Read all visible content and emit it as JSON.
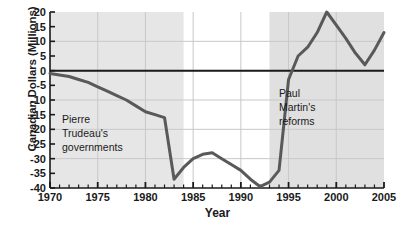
{
  "chart_data": {
    "type": "line",
    "title": "",
    "xlabel": "Year",
    "ylabel": "Canadian Dollars (Millions)",
    "xlim": [
      1970,
      2005
    ],
    "ylim": [
      -40,
      20
    ],
    "xticks": [
      1970,
      1975,
      1980,
      1985,
      1990,
      1995,
      2000,
      2005
    ],
    "xtick_labels": [
      "1970",
      "1975",
      "1980",
      "1985",
      "1990",
      "1995",
      "2000",
      "2005"
    ],
    "xminor_tick_step": 1,
    "yticks": [
      20,
      15,
      10,
      5,
      0,
      -5,
      -10,
      -15,
      -20,
      -25,
      -30,
      -35,
      -40
    ],
    "ytick_labels": [
      "20",
      "15",
      "10",
      "5",
      "0",
      "-5",
      "-10",
      "-15",
      "-20",
      "-25",
      "-30",
      "-35",
      "-40"
    ],
    "grid": true,
    "grid_x_values": [
      1975,
      1980,
      1985,
      1990,
      1995,
      2000
    ],
    "grid_y_values": [
      10,
      0,
      -10,
      -20,
      -30
    ],
    "legend": "none",
    "zero_line": 0,
    "series": [
      {
        "name": "Canadian federal budget balance",
        "color": "#595959",
        "x": [
          1970,
          1971,
          1972,
          1973,
          1974,
          1975,
          1976,
          1977,
          1978,
          1979,
          1980,
          1981,
          1982,
          1983,
          1984,
          1985,
          1986,
          1987,
          1988,
          1989,
          1990,
          1991,
          1992,
          1993,
          1994,
          1995,
          1996,
          1997,
          1998,
          1999,
          2000,
          2001,
          2002,
          2003,
          2004,
          2005
        ],
        "values": [
          -1,
          -1.5,
          -2,
          -3,
          -4,
          -5.5,
          -7,
          -8.5,
          -10,
          -12,
          -14,
          -15,
          -16,
          -37,
          -33,
          -30,
          -28.5,
          -28,
          -30,
          -32,
          -34,
          -37,
          -39.5,
          -38,
          -34,
          -3,
          5,
          8,
          13,
          20,
          15.5,
          11,
          6,
          2,
          7,
          13
        ],
        "annotated_points": [
          {
            "x": 1970,
            "y": -1
          },
          {
            "x": 1983,
            "y": -37
          },
          {
            "x": 1987,
            "y": -28
          },
          {
            "x": 1992,
            "y": -39.5
          },
          {
            "x": 1999,
            "y": 20
          },
          {
            "x": 2003,
            "y": 2
          },
          {
            "x": 2005,
            "y": 13
          }
        ]
      }
    ],
    "shaded_regions": [
      {
        "name": "pierre-trudeau-governments",
        "x_start": 1970,
        "x_end": 1984,
        "color": "#e6e6e6"
      },
      {
        "name": "paul-martin-reforms",
        "x_start": 1993,
        "x_end": 2005,
        "color": "#e0e0e0"
      }
    ],
    "annotations": [
      {
        "name": "trudeau",
        "lines": [
          "Pierre",
          "Trudeau's",
          "governments"
        ]
      },
      {
        "name": "martin",
        "lines": [
          "Paul",
          "Martin's",
          "reforms"
        ]
      }
    ]
  },
  "annotations": {
    "trudeau": {
      "line1": "Pierre",
      "line2": "Trudeau's",
      "line3": "governments"
    },
    "martin": {
      "line1": "Paul",
      "line2": "Martin's",
      "line3": "reforms"
    }
  },
  "axes": {
    "x_title": "Year",
    "y_title": "Canadian Dollars (Millions)"
  },
  "colors": {
    "line": "#595959",
    "axis": "#1a1a1a",
    "grid": "#c8c8c8",
    "shade": "#e6e6e6",
    "background": "#ffffff"
  }
}
